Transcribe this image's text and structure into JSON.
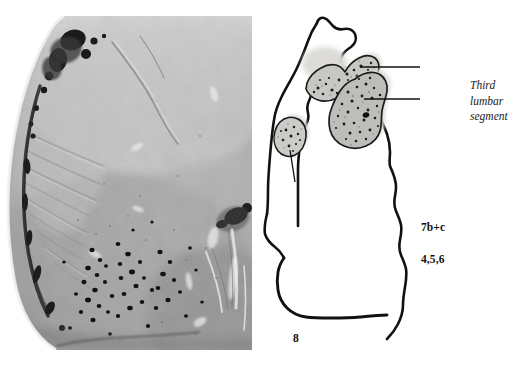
{
  "figure": {
    "caption_lines": [
      "Third",
      "lumbar",
      "segment"
    ],
    "background_color": "#ffffff",
    "ink_color": "#111111"
  },
  "photomicrograph": {
    "name": "spinal-cord-ventral-horn-photomicrograph",
    "description": "Grayscale histological section of spinal cord ventral horn",
    "tone_light": "#e8e8e8",
    "tone_mid": "#a8a8a8",
    "tone_dark": "#4a4a4a",
    "neuron_color": "#15151a"
  },
  "drawing": {
    "name": "spinal-cord-outline-tracing",
    "outline_color": "#111111",
    "nucleus_fill": "#c9c7c4",
    "nucleus_halo": "#dedcd9",
    "stipple_color": "#1a1a1a",
    "nuclei": [
      {
        "id": "nucleus-7bc",
        "label": "7b+c"
      },
      {
        "id": "nucleus-456",
        "label": "4,5,6"
      },
      {
        "id": "nucleus-8",
        "label": "8"
      }
    ],
    "labels": {
      "seven_bc": "7b+c",
      "four_five_six": "4,5,6",
      "eight": "8"
    }
  }
}
